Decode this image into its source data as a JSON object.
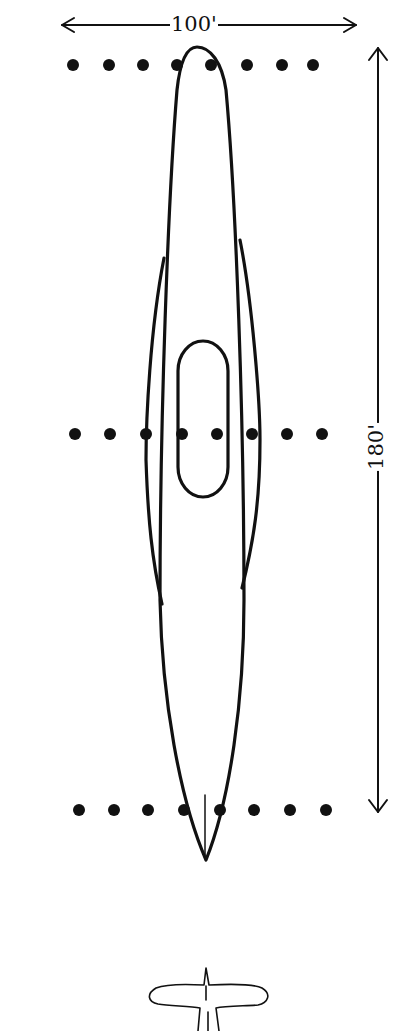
{
  "dimensions": {
    "width_label": "100'",
    "length_label": "180'"
  },
  "colors": {
    "ink": "#111111",
    "background": "#ffffff"
  },
  "light_rows": [
    {
      "name": "top",
      "y": 65,
      "x": [
        73,
        109,
        143,
        177,
        211,
        247,
        282,
        313
      ]
    },
    {
      "name": "middle",
      "y": 434,
      "x": [
        75,
        110,
        146,
        182,
        217,
        252,
        287,
        322
      ]
    },
    {
      "name": "bottom",
      "y": 810,
      "x": [
        79,
        114,
        148,
        184,
        220,
        254,
        290,
        326
      ]
    }
  ],
  "icons": {
    "airplane": "airplane-icon"
  }
}
